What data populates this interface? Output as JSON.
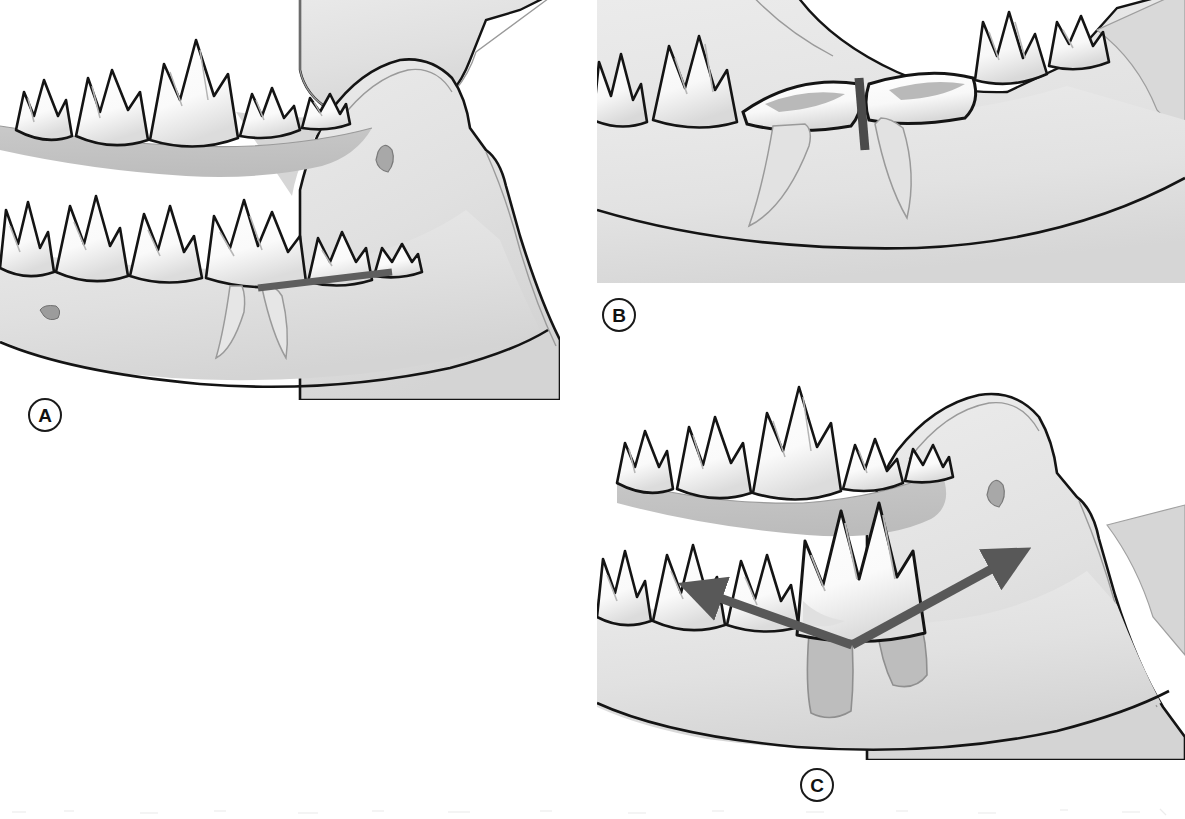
{
  "figure": {
    "background_color": "#ffffff",
    "width": 1185,
    "height": 819
  },
  "palette": {
    "outline": "#141414",
    "tooth_fill": "#fdfdfd",
    "tooth_shadow": "#d8d8d8",
    "tooth_highlight": "#ffffff",
    "bone_fill": "#e3e3e3",
    "bone_deep": "#d2d2d2",
    "oral_cavity": "#c4c4c4",
    "socket_fill": "#bdbdbd",
    "root_ghost_stroke": "#9a9a9a",
    "marker_gray": "#5e5e5e",
    "label_text": "#111111"
  },
  "panels": [
    {
      "id": "A",
      "label": "A",
      "name": "panel-a-sectioning-line",
      "caption": "",
      "annotation": {
        "type": "line",
        "name": "section-line-marker",
        "color": "#5e5e5e",
        "description": "Straight gray line drawn across the crown of the mandibular first molar at the furcation level, marking the plane of sectioning.",
        "x1": 258,
        "y1": 288,
        "x2": 392,
        "y2": 272,
        "stroke_width": 7
      },
      "anatomy": [
        "maxillary-premolars",
        "maxillary-molar",
        "mandibular-premolars",
        "mandibular-first-molar",
        "mandibular-second-molar",
        "mandibular-ramus",
        "mandibular-foramen",
        "mental-foramen",
        "oral-cavity"
      ]
    },
    {
      "id": "B",
      "label": "B",
      "name": "panel-b-sectioned-crown",
      "caption": "",
      "annotation": {
        "type": "line",
        "name": "section-cut-marker",
        "color": "#4a4a4a",
        "description": "Short vertical gray line between the two separated crown halves, showing the completed section through the furcation.",
        "x1": 262,
        "y1": 82,
        "x2": 268,
        "y2": 148,
        "stroke_width": 9
      },
      "anatomy": [
        "mandibular-premolar",
        "sectioned-crown-mesial-half",
        "sectioned-crown-distal-half",
        "mesial-root-ghost",
        "distal-root-ghost",
        "mandibular-second-molar",
        "mandibular-third-molar",
        "mandible-body"
      ]
    },
    {
      "id": "C",
      "label": "C",
      "name": "panel-c-elevation-arrows",
      "caption": "",
      "annotation": {
        "type": "double-arrow",
        "name": "elevation-direction-arrows",
        "color": "#585858",
        "description": "Two gray arrows originating from a common vertex at the cervical line of the molar, pointing mesially and distally to indicate the directions of elevator force.",
        "vertex": {
          "x": 255,
          "y": 290
        },
        "arrow_mesial": {
          "x": 85,
          "y": 230
        },
        "arrow_distal": {
          "x": 432,
          "y": 195
        },
        "stroke_width": 9
      },
      "anatomy": [
        "maxillary-premolars",
        "maxillary-molar",
        "mandibular-premolars",
        "elevated-molar-crown",
        "empty-alveolar-socket-mesial",
        "empty-alveolar-socket-distal",
        "mandibular-ramus",
        "mandibular-foramen",
        "oral-cavity"
      ]
    }
  ]
}
